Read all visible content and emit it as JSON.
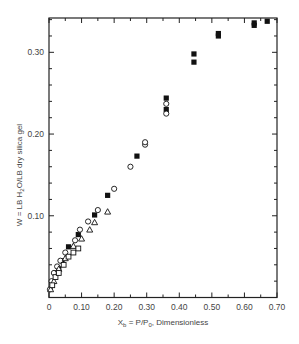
{
  "chart_data": {
    "type": "scatter",
    "title": "",
    "xlabel": "X_b = P/P_0, Dimensionless",
    "xlabel_parts": {
      "main": "X",
      "sub": "b",
      "mid": " = P/P",
      "sub2": "0",
      "tail": ", Dimensionless"
    },
    "ylabel": "W = LB H2O/LB dry silica gel",
    "ylabel_parts": {
      "pre": "W = LB  H",
      "sub": "2",
      "post": "O/LB  dry silica gel"
    },
    "xlim": [
      0,
      0.7
    ],
    "ylim": [
      0,
      0.342
    ],
    "grid": false,
    "legend": null,
    "x_ticks": [
      "0",
      "0.10",
      "0.20",
      "0.30",
      "0.40",
      "0.50",
      "0.60",
      "0.70"
    ],
    "x_tick_values": [
      0,
      0.1,
      0.2,
      0.3,
      0.4,
      0.5,
      0.6,
      0.7
    ],
    "y_ticks": [
      "0.10",
      "0.20",
      "0.30"
    ],
    "y_tick_values": [
      0.1,
      0.2,
      0.3
    ],
    "series": [
      {
        "name": "filled squares",
        "marker": "filled-square",
        "points": [
          [
            0.01,
            0.018
          ],
          [
            0.02,
            0.03
          ],
          [
            0.03,
            0.035
          ],
          [
            0.04,
            0.045
          ],
          [
            0.06,
            0.062
          ],
          [
            0.09,
            0.077
          ],
          [
            0.14,
            0.101
          ],
          [
            0.18,
            0.125
          ],
          [
            0.27,
            0.173
          ],
          [
            0.36,
            0.23
          ],
          [
            0.36,
            0.244
          ],
          [
            0.445,
            0.288
          ],
          [
            0.445,
            0.298
          ],
          [
            0.52,
            0.32
          ],
          [
            0.52,
            0.323
          ],
          [
            0.63,
            0.333
          ],
          [
            0.63,
            0.336
          ],
          [
            0.67,
            0.338
          ]
        ]
      },
      {
        "name": "open circles",
        "marker": "open-circle",
        "points": [
          [
            0.003,
            0.01
          ],
          [
            0.008,
            0.02
          ],
          [
            0.015,
            0.03
          ],
          [
            0.025,
            0.038
          ],
          [
            0.035,
            0.045
          ],
          [
            0.05,
            0.055
          ],
          [
            0.08,
            0.07
          ],
          [
            0.095,
            0.083
          ],
          [
            0.12,
            0.093
          ],
          [
            0.15,
            0.107
          ],
          [
            0.2,
            0.133
          ],
          [
            0.25,
            0.16
          ],
          [
            0.295,
            0.187
          ],
          [
            0.295,
            0.19
          ],
          [
            0.36,
            0.225
          ],
          [
            0.36,
            0.237
          ]
        ]
      },
      {
        "name": "open triangles",
        "marker": "open-triangle",
        "points": [
          [
            0.005,
            0.01
          ],
          [
            0.015,
            0.02
          ],
          [
            0.03,
            0.035
          ],
          [
            0.05,
            0.048
          ],
          [
            0.075,
            0.063
          ],
          [
            0.1,
            0.072
          ],
          [
            0.125,
            0.083
          ],
          [
            0.14,
            0.092
          ],
          [
            0.18,
            0.105
          ]
        ]
      },
      {
        "name": "open squares",
        "marker": "open-square",
        "points": [
          [
            0.01,
            0.015
          ],
          [
            0.02,
            0.025
          ],
          [
            0.03,
            0.03
          ],
          [
            0.045,
            0.04
          ],
          [
            0.06,
            0.05
          ],
          [
            0.075,
            0.055
          ],
          [
            0.09,
            0.06
          ]
        ]
      }
    ],
    "colors": {
      "axis": "#222222",
      "marker": "#111111",
      "text": "#444444"
    }
  }
}
